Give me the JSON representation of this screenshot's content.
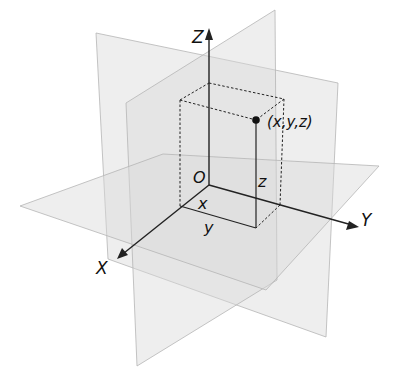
{
  "diagram": {
    "type": "3d-coordinate-system",
    "colors": {
      "background": "#ffffff",
      "plane_fill": "#d9d9d9",
      "plane_edge": "#b5b5b5",
      "axis": "#222222",
      "text": "#111111"
    },
    "axes": {
      "x": {
        "label": "X"
      },
      "y": {
        "label": "Y"
      },
      "z": {
        "label": "Z"
      }
    },
    "origin": {
      "label": "O"
    },
    "point": {
      "label": "(x,y,z)"
    },
    "components": {
      "x": "x",
      "y": "y",
      "z": "z"
    },
    "planes": [
      "XY-plane",
      "YZ-plane",
      "XZ-plane"
    ]
  }
}
